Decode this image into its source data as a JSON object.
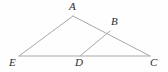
{
  "figure": {
    "name": "triangle-diagram",
    "background_color": "#fefefe",
    "line_color": "#a8a8a8",
    "line_width": 1,
    "label_color": "#2b2b2b"
  },
  "chart_data": {
    "type": "diagram",
    "title": "",
    "xlabel": "",
    "ylabel": "",
    "canvas": {
      "width": 168,
      "height": 72
    },
    "points": [
      {
        "id": "A",
        "label": "A",
        "x": 73,
        "y": 16,
        "label_x": 69,
        "label_y": 1
      },
      {
        "id": "B",
        "label": "B",
        "x": 110,
        "y": 31,
        "label_x": 111,
        "label_y": 16
      },
      {
        "id": "E",
        "label": "E",
        "x": 19,
        "y": 56,
        "label_x": 9,
        "label_y": 57
      },
      {
        "id": "D",
        "label": "D",
        "x": 80,
        "y": 56,
        "label_x": 75,
        "label_y": 57
      },
      {
        "id": "C",
        "label": "C",
        "x": 150,
        "y": 56,
        "label_x": 150,
        "label_y": 57
      }
    ],
    "segments": [
      {
        "id": "AE",
        "from": "A",
        "to": "E"
      },
      {
        "id": "AC",
        "from": "A",
        "to": "C"
      },
      {
        "id": "EC",
        "from": "E",
        "to": "C"
      },
      {
        "id": "DB",
        "from": "D",
        "to": "B"
      }
    ]
  },
  "labels": {
    "A": "A",
    "B": "B",
    "C": "C",
    "D": "D",
    "E": "E"
  }
}
